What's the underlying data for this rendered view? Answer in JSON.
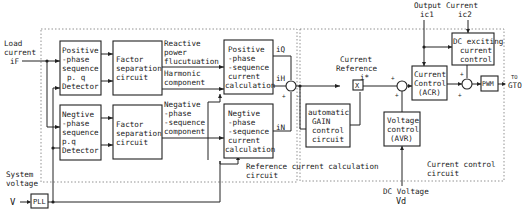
{
  "inputs": {
    "load_current": [
      "Load",
      "current",
      "iF"
    ],
    "system_voltage": [
      "System",
      "voltage"
    ],
    "v_symbol": "V",
    "output_current_label": "Output Current",
    "ic1": "ic1",
    "ic2": "ic2",
    "dc_voltage_label": "DC Voltage",
    "vd": "Vd",
    "to_gto": [
      "TO",
      "GTO"
    ]
  },
  "blocks": {
    "pos_detector": [
      "Positive",
      "-phase",
      "sequence",
      "p. q",
      "Detector"
    ],
    "neg_detector": [
      "Negtive",
      "-phase",
      "sequence",
      "p.q",
      "Detector"
    ],
    "factor_sep_1": [
      "Factor",
      "separation",
      "circuit"
    ],
    "factor_sep_2": [
      "Factor",
      "separation",
      "circuit"
    ],
    "pos_calc": [
      "Positive",
      "-phase",
      "-sequence",
      "current",
      "calculation"
    ],
    "neg_calc": [
      "Negtive",
      "-phase",
      "-sequence",
      "current",
      "calculation"
    ],
    "agc": [
      "automatic",
      "GAIN",
      "control",
      "circuit"
    ],
    "acr": [
      "Current",
      "Control",
      "(ACR)"
    ],
    "avr": [
      "Voltage",
      "control",
      "(AVR)"
    ],
    "dc_exciting": [
      "DC exciting",
      "current",
      "control"
    ],
    "pll": "PLL",
    "pwm": "PWM",
    "multiplier": "X"
  },
  "signals": {
    "reactive": [
      "Reactive",
      "power",
      "flucutuation"
    ],
    "harmonic": [
      "Harmonic",
      "component"
    ],
    "negative_comp": [
      "Negative",
      "-phase",
      "-sequence",
      "component"
    ],
    "iQ": "iQ",
    "iH": "iH",
    "iN": "iN",
    "current_reference": [
      "Current",
      "Reference",
      "i*"
    ]
  },
  "regions": {
    "reference": [
      "Reference current calculation",
      "circuit"
    ],
    "control": [
      "Current control",
      "circuit"
    ]
  }
}
